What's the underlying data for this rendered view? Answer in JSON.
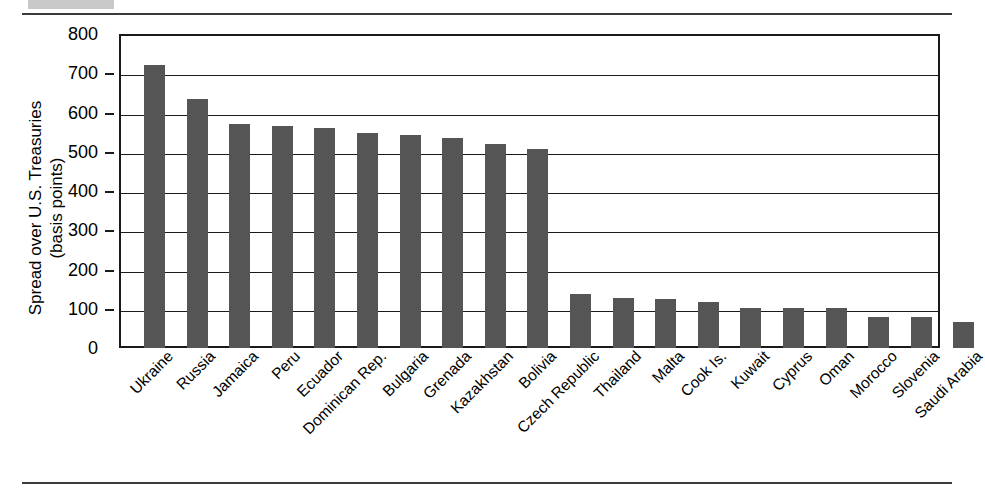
{
  "figure": {
    "ylabel_line1": "Spread over U.S. Treasuries",
    "ylabel_line2": "(basis points)"
  },
  "chart_data": {
    "type": "bar",
    "title": "",
    "xlabel": "",
    "ylabel": "Spread over U.S. Treasuries (basis points)",
    "ylim": [
      0,
      800
    ],
    "yticks": [
      0,
      100,
      200,
      300,
      400,
      500,
      600,
      700,
      800
    ],
    "grid": true,
    "legend": "none",
    "bar_color": "#555555",
    "categories": [
      "Ukraine",
      "Russia",
      "Jamaica",
      "Peru",
      "Ecuador",
      "Dominican Rep.",
      "Bulgaria",
      "Grenada",
      "Kazakhstan",
      "Bolivia",
      "Czech Republic",
      "Thailand",
      "Malta",
      "Cook Is.",
      "Kuwait",
      "Cyprus",
      "Oman",
      "Morocco",
      "Slovenia",
      "Saudi Arabia"
    ],
    "values": [
      720,
      635,
      572,
      565,
      560,
      547,
      542,
      535,
      520,
      507,
      137,
      128,
      125,
      117,
      103,
      103,
      101,
      80,
      79,
      66
    ]
  }
}
